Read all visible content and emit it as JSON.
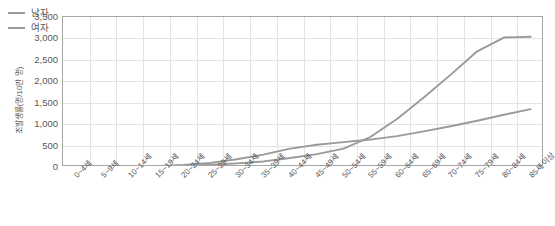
{
  "chart_data": {
    "type": "line",
    "title": "",
    "xlabel": "",
    "ylabel": "조발생률(명/10만 명)",
    "ylim": [
      0,
      3500
    ],
    "ytick_step": 500,
    "yticks": [
      "0",
      "500",
      "1,000",
      "1,500",
      "2,000",
      "2,500",
      "3,000",
      "3,500"
    ],
    "ytick_values": [
      0,
      500,
      1000,
      1500,
      2000,
      2500,
      3000,
      3500
    ],
    "grid": true,
    "legend_position": "top-left",
    "categories": [
      "0~4세",
      "5~9세",
      "10~14세",
      "15~19세",
      "20~24세",
      "25~29세",
      "30~34세",
      "35~39세",
      "40~44세",
      "45~49세",
      "50~54세",
      "55~59세",
      "60~64세",
      "65~69세",
      "70~74세",
      "75~79세",
      "80~84세",
      "85세 이상"
    ],
    "series": [
      {
        "name": "남자",
        "color": "#9a9a9a",
        "values": [
          18,
          10,
          12,
          18,
          30,
          52,
          85,
          130,
          210,
          300,
          430,
          700,
          1120,
          1620,
          2150,
          2700,
          3020,
          3040
        ]
      },
      {
        "name": "여자",
        "color": "#9a9a9a",
        "values": [
          15,
          9,
          11,
          22,
          45,
          95,
          180,
          290,
          430,
          520,
          580,
          640,
          720,
          830,
          950,
          1080,
          1220,
          1350
        ]
      }
    ]
  },
  "legend": {
    "items": [
      {
        "label": "남자"
      },
      {
        "label": "여자"
      }
    ]
  },
  "axis": {
    "y_title": "조발생률(명/10만 명)"
  }
}
